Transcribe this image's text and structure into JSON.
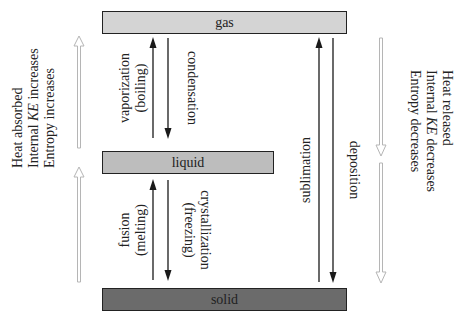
{
  "phases": {
    "gas": "gas",
    "liquid": "liquid",
    "solid": "solid"
  },
  "transitions": {
    "vaporization": [
      "vaporization",
      "(boiling)"
    ],
    "condensation": "condensation",
    "fusion": [
      "fusion",
      "(melting)"
    ],
    "crystallization": [
      "crystallization",
      "(freezing)"
    ],
    "sublimation": "sublimation",
    "deposition": "deposition"
  },
  "left_annotation": {
    "line1": "Heat absorbed",
    "line2_prefix": "Internal ",
    "line2_italic": "KE",
    "line2_suffix": " increases",
    "line3": "Entropy increases"
  },
  "right_annotation": {
    "line1": "Heat released",
    "line2_prefix": "Internal ",
    "line2_italic": "KE",
    "line2_suffix": " decreases",
    "line3": "Entropy decreases"
  },
  "colors": {
    "gas_fill": "#d4d4d4",
    "liquid_fill": "#bdbdbd",
    "solid_fill": "#6b6b6b",
    "arrow": "#1a1a1a",
    "hollow_arrow": "#b5b5b5"
  }
}
